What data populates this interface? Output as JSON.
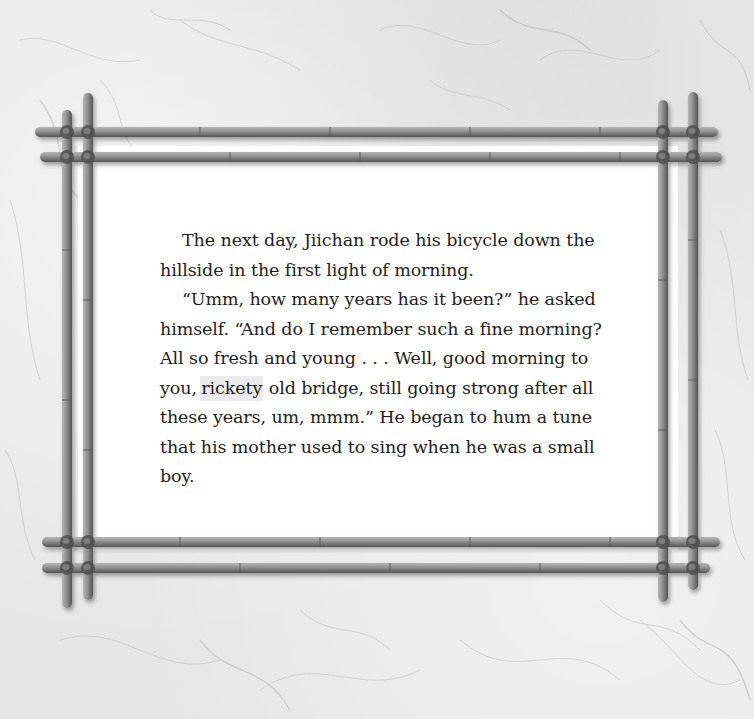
{
  "page": {
    "background_color": "#e6e6e6",
    "page_color": "#ffffff",
    "text_color": "#1e1e1e",
    "highlight_color": "#ebebeb",
    "bamboo_color": "#8a8a8a"
  },
  "story": {
    "paragraphs": [
      {
        "text": "The next day, Jiichan rode his bicycle down the hillside in the first light of morning."
      },
      {
        "before_highlight": "“Umm, how many years has it been?” he asked himself.  “And do I remember such a fine morning? All so fresh and young . . . Well, good morning to you, ",
        "highlighted_word": "rickety",
        "after_highlight": " old bridge, still going strong after all these years, um, mmm.”  He began to hum a tune that his mother used to sing when he was a small boy."
      }
    ]
  },
  "frame": {
    "type": "bamboo-frame",
    "icon": "bamboo-frame-decoration"
  }
}
